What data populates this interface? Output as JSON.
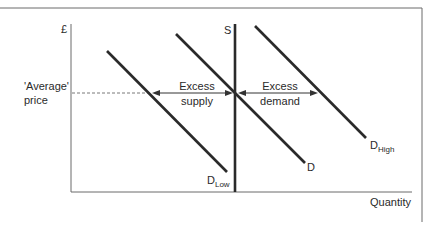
{
  "diagram": {
    "y_axis_label": "£",
    "x_axis_label": "Quantity",
    "price_label_line1": "'Average'",
    "price_label_line2": "price",
    "supply_label": "S",
    "curves": {
      "d_low": {
        "label": "D",
        "subscript": "Low"
      },
      "d": {
        "label": "D"
      },
      "d_high": {
        "label": "D",
        "subscript": "High"
      }
    },
    "annotations": {
      "excess_supply_line1": "Excess",
      "excess_supply_line2": "supply",
      "excess_demand_line1": "Excess",
      "excess_demand_line2": "demand"
    },
    "colors": {
      "line": "#2a2a2a",
      "frame": "#6a6a6a",
      "axis": "#6a6a6a"
    }
  }
}
